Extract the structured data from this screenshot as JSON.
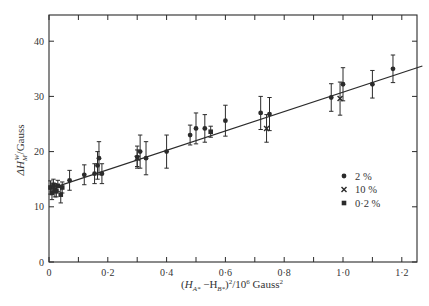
{
  "chart_data": {
    "type": "scatter",
    "title": "",
    "xlabel": "(H_A* − H_B*)²/10⁶ Gauss²",
    "ylabel": "ΔH_M^W/Gauss",
    "xlim": [
      0,
      1.3
    ],
    "ylim": [
      0,
      45
    ],
    "x_ticks": [
      0,
      0.2,
      0.4,
      0.6,
      0.8,
      1.0,
      1.2
    ],
    "x_tick_labels": [
      "0",
      "0·2",
      "0·4",
      "0·6",
      "0·8",
      "1·0",
      "1·2"
    ],
    "y_ticks": [
      0,
      10,
      20,
      30,
      40
    ],
    "y_tick_labels": [
      "0",
      "10",
      "20",
      "30",
      "40"
    ],
    "grid": false,
    "legend": {
      "position": "right-center",
      "entries": [
        {
          "marker": "circle",
          "label": "2 %"
        },
        {
          "marker": "cross",
          "label": "10 %"
        },
        {
          "marker": "square",
          "label": "0·2 %"
        }
      ]
    },
    "fit_line": {
      "x": [
        0,
        1.27
      ],
      "y": [
        13.2,
        35.5
      ]
    },
    "series": [
      {
        "name": "0·2 %",
        "marker": "square",
        "points": [
          {
            "x": 0.005,
            "y": 13.5,
            "err": 1.2
          },
          {
            "x": 0.01,
            "y": 12.5,
            "err": 1.2
          },
          {
            "x": 0.015,
            "y": 14.0,
            "err": 1.0
          },
          {
            "x": 0.02,
            "y": 13.0,
            "err": 1.2
          },
          {
            "x": 0.025,
            "y": 12.8,
            "err": 1.0
          },
          {
            "x": 0.03,
            "y": 13.8,
            "err": 1.0
          },
          {
            "x": 0.04,
            "y": 12.2,
            "err": 1.5
          },
          {
            "x": 0.045,
            "y": 13.5,
            "err": 1.0
          },
          {
            "x": 0.55,
            "y": 23.6,
            "err": 1.0
          }
        ]
      },
      {
        "name": "2 %",
        "marker": "circle",
        "points": [
          {
            "x": 0.07,
            "y": 14.8,
            "err": 1.8
          },
          {
            "x": 0.12,
            "y": 15.8,
            "err": 1.8
          },
          {
            "x": 0.155,
            "y": 16.0,
            "err": 1.8
          },
          {
            "x": 0.165,
            "y": 17.5,
            "err": 2.5
          },
          {
            "x": 0.17,
            "y": 18.8,
            "err": 3.0
          },
          {
            "x": 0.18,
            "y": 16.0,
            "err": 1.8
          },
          {
            "x": 0.3,
            "y": 19.0,
            "err": 2.0
          },
          {
            "x": 0.31,
            "y": 20.0,
            "err": 3.0
          },
          {
            "x": 0.33,
            "y": 18.8,
            "err": 3.0
          },
          {
            "x": 0.4,
            "y": 20.0,
            "err": 3.0
          },
          {
            "x": 0.48,
            "y": 23.0,
            "err": 1.8
          },
          {
            "x": 0.5,
            "y": 24.2,
            "err": 2.8
          },
          {
            "x": 0.53,
            "y": 24.2,
            "err": 2.5
          },
          {
            "x": 0.6,
            "y": 25.6,
            "err": 2.8
          },
          {
            "x": 0.72,
            "y": 27.0,
            "err": 3.0
          },
          {
            "x": 0.75,
            "y": 26.8,
            "err": 3.0
          },
          {
            "x": 0.96,
            "y": 29.8,
            "err": 2.5
          },
          {
            "x": 1.0,
            "y": 32.2,
            "err": 3.0
          },
          {
            "x": 1.1,
            "y": 32.2,
            "err": 2.5
          },
          {
            "x": 1.17,
            "y": 35.0,
            "err": 2.5
          }
        ]
      },
      {
        "name": "10 %",
        "marker": "cross",
        "points": [
          {
            "x": 0.3,
            "y": 18.8,
            "err": 1.5
          },
          {
            "x": 0.74,
            "y": 24.2,
            "err": 2.5
          },
          {
            "x": 0.99,
            "y": 29.6,
            "err": 3.0
          }
        ]
      }
    ]
  },
  "legend": {
    "entries": [
      {
        "label": "2 %"
      },
      {
        "label": "10 %"
      },
      {
        "label": "0·2 %"
      }
    ]
  },
  "axes": {
    "xlabel_parts": {
      "open": "(",
      "ha": "H",
      "ha_sub": "A*",
      "minus": " −H",
      "hb_sub": "B*",
      "close": ")",
      "sup2": "2",
      "rest": "/10",
      "exp": "6",
      "unit": " Gauss",
      "unit_sup": "2"
    },
    "ylabel_parts": {
      "delta": "ΔH",
      "sub": "M",
      "sup": "W",
      "rest": "/Gauss"
    }
  }
}
